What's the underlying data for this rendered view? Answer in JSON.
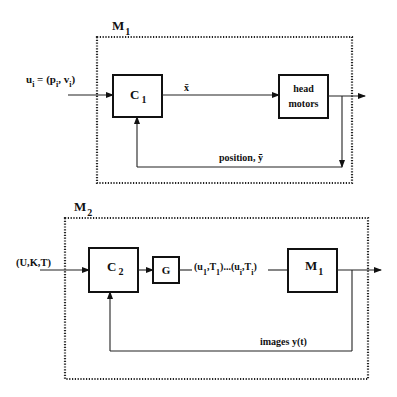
{
  "diagram": {
    "top": {
      "module_label": "M",
      "module_sub": "1",
      "input_label": {
        "var": "u",
        "var_sub": "i",
        "eq": " = (p",
        "p_sub": "i",
        "mid": ", v",
        "v_sub": "i",
        "close": ")"
      },
      "controller": {
        "label": "C",
        "sub": "1"
      },
      "signal_label": "x̄",
      "plant": {
        "line1": "head",
        "line2": "motors"
      },
      "feedback_label": "position, ȳ"
    },
    "bottom": {
      "module_label": "M",
      "module_sub": "2",
      "input_label": "(U,K,T)",
      "controller": {
        "label": "C",
        "sub": "2"
      },
      "generator": {
        "label": "G"
      },
      "sequence_label": {
        "open1": "(u",
        "u1_sub": "1",
        "t1": ",T",
        "t1_sub": "1",
        "mid": ")...(u",
        "ui_sub": "i",
        "ti": ",T",
        "ti_sub": "i",
        "close": ")"
      },
      "plant": {
        "label": "M",
        "sub": "1"
      },
      "feedback_label": "images y(t)"
    }
  }
}
